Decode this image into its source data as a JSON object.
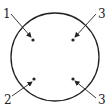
{
  "diagram": {
    "circle": {
      "cx": 55,
      "cy": 57,
      "r": 44,
      "stroke": "#222222"
    },
    "points": [
      {
        "label": "1",
        "label_x": 3,
        "label_y": 18,
        "line_from": [
          11,
          14
        ],
        "dot": [
          33,
          40
        ]
      },
      {
        "label": "3",
        "label_x": 98,
        "label_y": 18,
        "line_from": [
          96,
          14
        ],
        "dot": [
          73,
          40
        ]
      },
      {
        "label": "2",
        "label_x": 4,
        "label_y": 104,
        "line_from": [
          12,
          96
        ],
        "dot": [
          34,
          79
        ]
      },
      {
        "label": "3",
        "label_x": 98,
        "label_y": 104,
        "line_from": [
          96,
          98
        ],
        "dot": [
          73,
          79
        ]
      }
    ]
  }
}
